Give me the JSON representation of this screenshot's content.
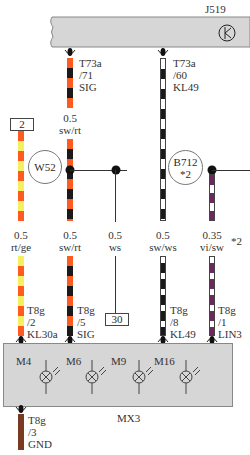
{
  "top_module": {
    "id": "J519",
    "symbol": "k-ground-symbol"
  },
  "bottom_module": {
    "id": "MX3",
    "lamps": [
      {
        "label": "M4"
      },
      {
        "label": "M6"
      },
      {
        "label": "M9"
      },
      {
        "label": "M16"
      }
    ]
  },
  "wires": [
    {
      "id": "wire-rt-ge",
      "gauge": "0.5",
      "color_code": "rt/ge",
      "colors": [
        "#ff5a1f",
        "#f4f060"
      ],
      "top_tag": "2",
      "bottom_connector": {
        "connector": "T8g",
        "pin": "/2",
        "signal": "KL30a"
      }
    },
    {
      "id": "wire-sw-rt",
      "gauge_top": "0.5",
      "color_code_top": "sw/rt",
      "gauge": "0.5",
      "color_code": "sw/rt",
      "colors": [
        "#ff5a1f",
        "#1a1a1a"
      ],
      "top_connector": {
        "connector": "T73a",
        "pin": "/71",
        "signal": "SIG"
      },
      "splice": "W52",
      "bottom_connector": {
        "connector": "T8g",
        "pin": "/5",
        "signal": "SIG"
      }
    },
    {
      "id": "wire-ws",
      "gauge": "0.5",
      "color_code": "ws",
      "bottom_tag": "30"
    },
    {
      "id": "wire-sw-ws",
      "gauge": "0.5",
      "color_code": "sw/ws",
      "colors": [
        "#ffffff",
        "#1a1a1a"
      ],
      "top_connector": {
        "connector": "T73a",
        "pin": "/60",
        "signal": "KL49"
      },
      "bottom_connector": {
        "connector": "T8g",
        "pin": "/8",
        "signal": "KL49"
      }
    },
    {
      "id": "wire-vi-sw",
      "gauge": "0.35",
      "color_code": "vi/sw",
      "note": "*2",
      "colors": [
        "#ffffff",
        "#6a2a5e"
      ],
      "splice": "B712",
      "splice_note": "*2",
      "bottom_connector": {
        "connector": "T8g",
        "pin": "/1",
        "signal": "LIN3"
      }
    },
    {
      "id": "wire-gnd",
      "color_code": "br",
      "colors": [
        "#7a3a22"
      ],
      "bottom_connector": {
        "connector": "T8g",
        "pin": "/3",
        "signal": "GND"
      }
    }
  ]
}
